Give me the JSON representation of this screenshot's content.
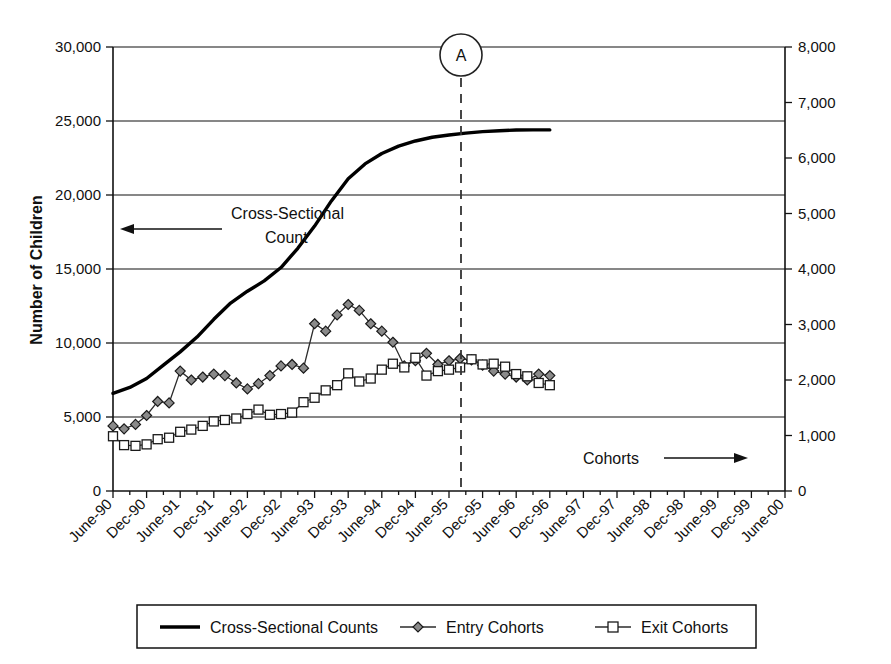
{
  "chart_data": {
    "type": "line",
    "title": "",
    "xlabel": "",
    "ylabel": "Number of Children",
    "ylabel_right": "",
    "ylim": [
      0,
      30000
    ],
    "ylim_right": [
      0,
      8000
    ],
    "yticks": [
      "0",
      "5,000",
      "10,000",
      "15,000",
      "20,000",
      "25,000",
      "30,000"
    ],
    "ytick_values": [
      0,
      5000,
      10000,
      15000,
      20000,
      25000,
      30000
    ],
    "yticks_right": [
      "0",
      "1,000",
      "2,000",
      "3,000",
      "4,000",
      "5,000",
      "6,000",
      "7,000",
      "8,000"
    ],
    "ytick_values_right": [
      0,
      1000,
      2000,
      3000,
      4000,
      5000,
      6000,
      7000,
      8000
    ],
    "grid": "horizontal",
    "legend_position": "bottom",
    "categories": [
      "June-90",
      "Dec-90",
      "June-91",
      "Dec-91",
      "June-92",
      "Dec-92",
      "June-93",
      "Dec-93",
      "June-94",
      "Dec-94",
      "June-95",
      "Dec-95",
      "June-96",
      "Dec-96",
      "June-97",
      "Dec-97",
      "June-98",
      "Dec-98",
      "June-99",
      "Dec-99",
      "June-00"
    ],
    "series": [
      {
        "name": "Cross-Sectional Counts",
        "axis": "left",
        "marker": "none",
        "x": [
          0,
          0.5,
          1,
          1.5,
          2,
          2.5,
          3,
          3.5,
          4,
          4.5,
          5,
          5.5,
          6,
          6.5,
          7,
          7.5,
          8,
          8.5,
          9,
          9.5,
          10,
          10.5,
          11,
          11.5,
          12,
          12.5,
          13
        ],
        "values": [
          6600,
          7000,
          7600,
          8500,
          9400,
          10400,
          11600,
          12700,
          13500,
          14200,
          15100,
          16400,
          17900,
          19600,
          21100,
          22100,
          22800,
          23300,
          23650,
          23900,
          24050,
          24180,
          24280,
          24340,
          24390,
          24400,
          24400
        ]
      },
      {
        "name": "Entry Cohorts",
        "axis": "right",
        "marker": "diamond",
        "x": [
          0,
          0.33,
          0.67,
          1,
          1.33,
          1.67,
          2,
          2.33,
          2.67,
          3,
          3.33,
          3.67,
          4,
          4.33,
          4.67,
          5,
          5.33,
          5.67,
          6,
          6.33,
          6.67,
          7,
          7.33,
          7.67,
          8,
          8.33,
          8.67,
          9,
          9.33,
          9.67,
          10,
          10.33,
          10.67,
          11,
          11.33,
          11.67,
          12,
          12.33,
          12.67,
          13
        ],
        "values_left_scale": [
          4400,
          4200,
          4500,
          5100,
          6050,
          5950,
          8100,
          7500,
          7700,
          7900,
          7800,
          7300,
          6900,
          7250,
          7800,
          8450,
          8550,
          8300,
          11300,
          10800,
          11900,
          12600,
          12200,
          11300,
          10800,
          10050,
          8450,
          8800,
          9300,
          8550,
          8800,
          8950,
          8850,
          8500,
          8100,
          7900,
          7700,
          7500,
          7900,
          7800
        ],
        "values": [
          1173,
          1120,
          1200,
          1360,
          1613,
          1587,
          2160,
          2000,
          2053,
          2107,
          2080,
          1947,
          1840,
          1933,
          2080,
          2253,
          2280,
          2213,
          3013,
          2880,
          3173,
          3360,
          3253,
          3013,
          2880,
          2680,
          2253,
          2347,
          2480,
          2280,
          2347,
          2387,
          2360,
          2267,
          2160,
          2107,
          2053,
          2000,
          2107,
          2080
        ]
      },
      {
        "name": "Exit Cohorts",
        "axis": "right",
        "marker": "square",
        "x": [
          0,
          0.33,
          0.67,
          1,
          1.33,
          1.67,
          2,
          2.33,
          2.67,
          3,
          3.33,
          3.67,
          4,
          4.33,
          4.67,
          5,
          5.33,
          5.67,
          6,
          6.33,
          6.67,
          7,
          7.33,
          7.67,
          8,
          8.33,
          8.67,
          9,
          9.33,
          9.67,
          10,
          10.33,
          10.67,
          11,
          11.33,
          11.67,
          12,
          12.33,
          12.67,
          13
        ],
        "values_left_scale": [
          3700,
          3100,
          3050,
          3150,
          3500,
          3600,
          4000,
          4150,
          4400,
          4700,
          4800,
          4900,
          5200,
          5500,
          5150,
          5200,
          5300,
          6000,
          6300,
          6800,
          7150,
          7950,
          7400,
          7600,
          8200,
          8600,
          8350,
          9000,
          7800,
          8100,
          8200,
          8350,
          8900,
          8550,
          8600,
          8400,
          7900,
          7750,
          7300,
          7150
        ],
        "values": [
          980,
          827,
          813,
          840,
          933,
          960,
          1067,
          1107,
          1173,
          1253,
          1280,
          1307,
          1387,
          1467,
          1373,
          1387,
          1413,
          1600,
          1680,
          1813,
          1907,
          2120,
          1973,
          2027,
          2187,
          2293,
          2227,
          2400,
          2080,
          2160,
          2187,
          2227,
          2373,
          2280,
          2293,
          2240,
          2107,
          2067,
          1947,
          1907
        ]
      }
    ],
    "annotations": [
      {
        "name": "cross-sectional-count",
        "text_line1": "Cross-Sectional",
        "text_line2": "Count",
        "arrow": "left"
      },
      {
        "name": "cohorts",
        "text_line1": "Cohorts",
        "arrow": "right"
      },
      {
        "name": "point-a-marker",
        "text": "A"
      }
    ]
  },
  "legend": {
    "items": [
      {
        "label": "Cross-Sectional Counts",
        "marker": "line"
      },
      {
        "label": "Entry Cohorts",
        "marker": "diamond"
      },
      {
        "label": "Exit Cohorts",
        "marker": "square"
      }
    ]
  },
  "colors": {
    "axis": "#111111",
    "grid": "#111111",
    "cross_sectional": "#000000",
    "entry_marker_fill": "#8a8a8a",
    "exit_marker_fill": "#ffffff",
    "dashed_marker": "#333333"
  }
}
